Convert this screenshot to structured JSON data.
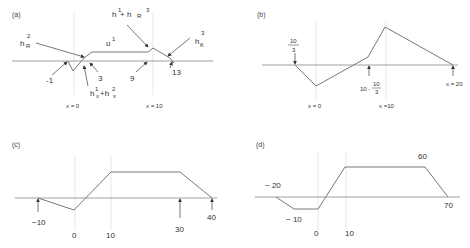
{
  "panels": {
    "a": {
      "tag": "(a)",
      "labels": {
        "hR2": "h",
        "hR2_sub": "R",
        "hR2_sup": "2",
        "u1": "u",
        "u1_sup": "1",
        "h1hR3": "h",
        "h1hR3_sup1": "1",
        "h1hR3_plus": "+ h",
        "h1hR3_sub": "R",
        "h1hR3_sup2": "3",
        "hK3": "h",
        "hK3_sub": "K",
        "hK3_sup": "3",
        "m1": "-1",
        "n3": "3",
        "n9": "9",
        "n13": "13",
        "hsum": "h",
        "hsum_sup1": "1",
        "hsum_sub1": "x",
        "hsum_plus": "+h",
        "hsum_sup2": "2",
        "hsum_sub2": "x",
        "x0": "x = 0",
        "x10": "x = 10"
      }
    },
    "b": {
      "tag": "(b)",
      "labels": {
        "frac_num": "10",
        "frac_den": "3",
        "mid_prefix": "10 -",
        "mid_num": "10",
        "mid_den": "3",
        "x0": "x = 0",
        "x10": "x =10",
        "x20": "x = 20"
      }
    },
    "c": {
      "tag": "(c)",
      "labels": {
        "m10": "−10",
        "z": "0",
        "t10": "10",
        "t30": "30",
        "t40": "40"
      }
    },
    "d": {
      "tag": "(d)",
      "labels": {
        "m20": "− 20",
        "m10": "− 10",
        "z": "0",
        "t10": "10",
        "t60": "60",
        "t70": "70"
      }
    }
  }
}
